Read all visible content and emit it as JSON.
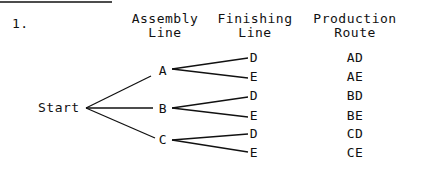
{
  "problem_number": "1.",
  "headers": {
    "assembly": [
      "Assembly",
      "Line"
    ],
    "finishing": [
      "Finishing",
      "Line"
    ],
    "route": [
      "Production",
      "Route"
    ]
  },
  "tree": {
    "root": "Start",
    "assembly_lines": [
      {
        "label": "A",
        "finishing": [
          "D",
          "E"
        ]
      },
      {
        "label": "B",
        "finishing": [
          "D",
          "E"
        ]
      },
      {
        "label": "C",
        "finishing": [
          "D",
          "E"
        ]
      }
    ]
  },
  "routes": [
    "AD",
    "AE",
    "BD",
    "BE",
    "CD",
    "CE"
  ],
  "colors": {
    "ink": "#111111",
    "background": "#ffffff"
  }
}
